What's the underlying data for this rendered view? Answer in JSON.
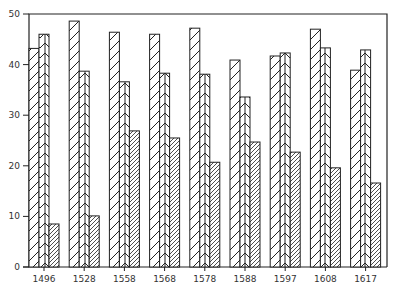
{
  "chart_data": {
    "type": "bar",
    "title": "",
    "xlabel": "",
    "ylabel": "",
    "ylim": [
      0,
      50
    ],
    "yticks": [
      0,
      10,
      20,
      30,
      40,
      50
    ],
    "grid": false,
    "legend": null,
    "categories": [
      "1496",
      "1528",
      "1558",
      "1568",
      "1578",
      "1588",
      "1597",
      "1608",
      "1617"
    ],
    "series": [
      {
        "name": "Series 1 (wide diagonal hatch)",
        "pattern": "diagonal",
        "values": [
          43.2,
          48.6,
          46.4,
          46.0,
          47.2,
          40.9,
          41.7,
          47.0,
          38.9
        ]
      },
      {
        "name": "Series 2 (chevron hatch)",
        "pattern": "chevron",
        "values": [
          46.0,
          38.7,
          36.6,
          38.3,
          38.1,
          33.6,
          42.3,
          43.3,
          42.9
        ]
      },
      {
        "name": "Series 3 (dense diagonal hatch)",
        "pattern": "dense-diagonal",
        "values": [
          8.5,
          10.1,
          26.9,
          25.5,
          20.7,
          24.7,
          22.7,
          19.6,
          16.6
        ]
      }
    ]
  },
  "layout": {
    "plot_left": 29,
    "plot_right": 387,
    "plot_top": 14,
    "plot_bottom": 267,
    "bar_width": 10,
    "group_pitch": 40.2,
    "first_group_left": 29
  },
  "colors": {
    "stroke": "#222222",
    "background": "#ffffff",
    "text": "#333333"
  }
}
